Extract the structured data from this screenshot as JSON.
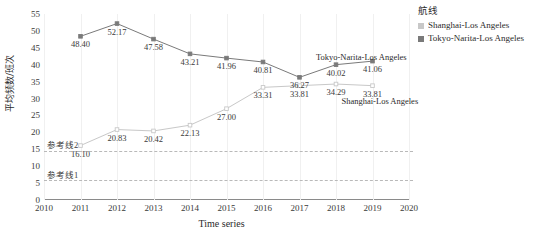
{
  "chart_data": {
    "type": "line",
    "title": "",
    "xlabel": "Time series",
    "ylabel": "平均频数/班次",
    "x": [
      2010,
      2011,
      2012,
      2013,
      2014,
      2015,
      2016,
      2017,
      2018,
      2019,
      2020
    ],
    "xticks": [
      "2010",
      "2011",
      "2012",
      "2013",
      "2014",
      "2015",
      "2016",
      "2017",
      "2018",
      "2019",
      "2020"
    ],
    "yticks": [
      "0",
      "5",
      "10",
      "15",
      "20",
      "25",
      "30",
      "35",
      "40",
      "45",
      "50",
      "55"
    ],
    "xlim": [
      2010,
      2020
    ],
    "ylim": [
      0,
      55
    ],
    "grid": false,
    "legend_position": "right",
    "series": [
      {
        "name": "Shanghai-Los Angeles",
        "color": "#c8c8c8",
        "x": [
          2011,
          2012,
          2013,
          2014,
          2015,
          2016,
          2017,
          2018,
          2019
        ],
        "values": [
          16.1,
          20.83,
          20.42,
          22.13,
          27.0,
          33.31,
          33.81,
          34.29,
          33.81
        ],
        "labels": [
          "16.10",
          "20.83",
          "20.42",
          "22.13",
          "27.00",
          "33.31",
          "33.81",
          "34.29",
          "33.81"
        ]
      },
      {
        "name": "Tokyo-Narita-Los Angeles",
        "color": "#7a7a7a",
        "x": [
          2011,
          2012,
          2013,
          2014,
          2015,
          2016,
          2017,
          2018,
          2019
        ],
        "values": [
          48.4,
          52.17,
          47.58,
          43.21,
          41.96,
          40.81,
          36.27,
          40.02,
          41.06
        ],
        "labels": [
          "48.40",
          "52.17",
          "47.58",
          "43.21",
          "41.96",
          "40.81",
          "36.27",
          "40.02",
          "41.06"
        ]
      }
    ],
    "reference_lines": [
      {
        "label": "参考线2",
        "value": 14.5
      },
      {
        "label": "参考线1",
        "value": 6.0
      }
    ],
    "annotations": [
      {
        "text": "Tokyo-Narita-Los Angeles",
        "series": 1
      },
      {
        "text": "Shanghai-Los Angeles",
        "series": 0
      }
    ]
  },
  "legend": {
    "title": "航线",
    "items": [
      {
        "label": "Shanghai-Los Angeles",
        "color": "#c8c8c8"
      },
      {
        "label": "Tokyo-Narita-Los Angeles",
        "color": "#7a7a7a"
      }
    ]
  }
}
